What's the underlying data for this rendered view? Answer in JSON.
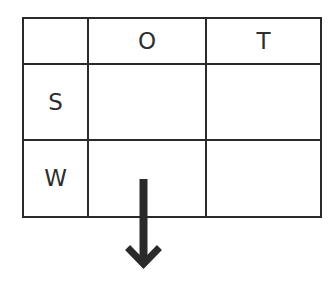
{
  "diagram": {
    "type": "grid-table",
    "column_headers": [
      "",
      "O",
      "T"
    ],
    "rows": [
      {
        "header": "S",
        "cells": [
          "",
          ""
        ]
      },
      {
        "header": "W",
        "cells": [
          "",
          ""
        ]
      }
    ],
    "arrow": {
      "direction": "down",
      "icon": "arrow-down-icon",
      "color": "#2a2a2a"
    },
    "line_color": "#2a2a2a",
    "text_color": "#2e2e2e"
  }
}
